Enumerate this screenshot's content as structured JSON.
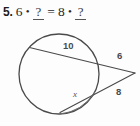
{
  "problem": {
    "number": "5.",
    "left_operand": "6",
    "multiply_symbol": "•",
    "left_blank": "?",
    "equals_symbol": "=",
    "right_operand": "8",
    "multiply_symbol_2": "•",
    "right_blank": "?"
  },
  "figure": {
    "type": "circle-secant-tangent-diagram",
    "labels": {
      "secant_outer_chord": "10",
      "secant_external_segment": "6",
      "tangent_external_segment": "8",
      "unknown_segment": "x"
    },
    "colors": {
      "stroke": "#4a4a4a",
      "background": "#fdfdfd",
      "text": "#4a4a4a"
    },
    "geometry": {
      "circle_center_x": 59,
      "circle_center_y": 54,
      "circle_radius": 40,
      "external_point_x": 135,
      "external_point_y": 53
    }
  }
}
